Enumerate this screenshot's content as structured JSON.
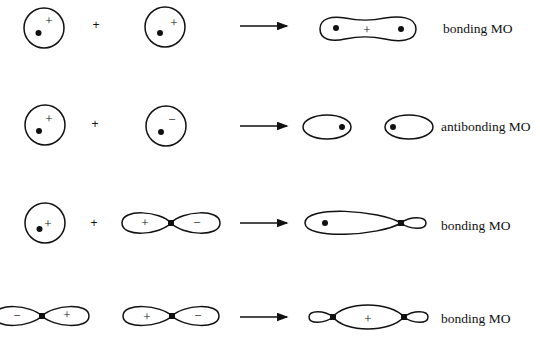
{
  "rows": [
    {
      "operands": [
        "s orbital (+)",
        "s orbital (+)"
      ],
      "plus": "+",
      "result": "bonding MO",
      "result_sign": "+",
      "atom1_sign": "+",
      "atom2_sign": "+"
    },
    {
      "operands": [
        "s orbital (+)",
        "s orbital (−)"
      ],
      "plus": "+",
      "result": "antibonding MO",
      "atom1_sign": "+",
      "atom2_sign": "−"
    },
    {
      "operands": [
        "s orbital (+)",
        "p orbital (+/−)"
      ],
      "plus": "+",
      "result": "bonding MO",
      "atom1_sign": "+",
      "p_left_sign": "+",
      "p_right_sign": "−"
    },
    {
      "operands": [
        "p orbital (−/+)",
        "p orbital (+/−)"
      ],
      "result": "bonding MO",
      "result_sign": "+",
      "p1_left_sign": "−",
      "p1_right_sign": "+",
      "p2_left_sign": "+",
      "p2_right_sign": "−"
    }
  ],
  "colors": {
    "ink": "#111111",
    "background": "#ffffff"
  }
}
